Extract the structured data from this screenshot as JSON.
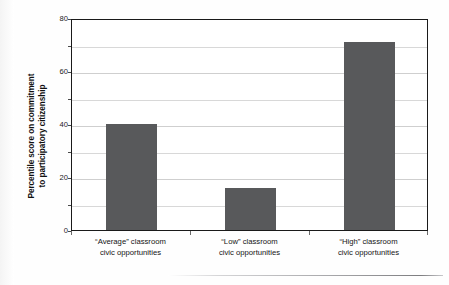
{
  "chart_data": {
    "type": "bar",
    "title": "",
    "xlabel": "",
    "ylabel": "Percentile score on commitment to participatory citizenship",
    "ylabel_line1": "Percentile score on commitment",
    "ylabel_line2": "to participatory citizenship",
    "categories": [
      "“Average” classroom civic opportunities",
      "“Low” classroom civic opportunities",
      "“High” classroom civic opportunities"
    ],
    "category_lines": [
      {
        "line1": "“Average” classroom",
        "line2": "civic opportunities"
      },
      {
        "line1": "“Low” classroom",
        "line2": "civic opportunities"
      },
      {
        "line1": "“High” classroom",
        "line2": "civic opportunities"
      }
    ],
    "values": [
      40,
      16,
      71
    ],
    "ylim": [
      0,
      80
    ],
    "ytick_labels": [
      "0",
      "20",
      "40",
      "60",
      "80"
    ],
    "ytick_values": [
      0,
      20,
      40,
      60,
      80
    ],
    "gridline_values": [
      10,
      20,
      30,
      40,
      50,
      60,
      70
    ],
    "grid": true,
    "legend": "none",
    "bar_color": "#58595B",
    "frame_color": "#1A1A1A",
    "gridline_color": "#D8D8D8"
  }
}
